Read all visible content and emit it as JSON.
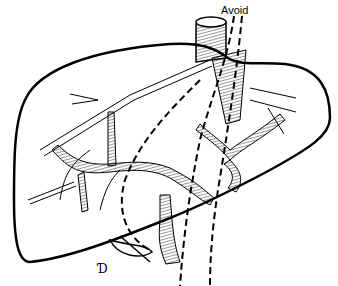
{
  "figure": {
    "annotations": [
      {
        "text": "Avoid",
        "x": 221,
        "y": 4
      }
    ],
    "signature": "Ɗ",
    "colors": {
      "ink": "#000000",
      "background": "#ffffff"
    }
  }
}
